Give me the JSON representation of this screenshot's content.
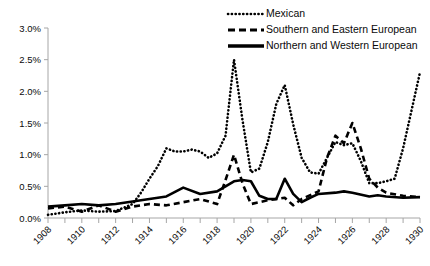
{
  "chart_data": {
    "type": "line",
    "title": "",
    "xlabel": "",
    "ylabel": "",
    "x": [
      1908,
      1909,
      1910,
      1911,
      1912,
      1913,
      1914,
      1915,
      1916,
      1917,
      1918,
      1919,
      1920,
      1921,
      1922,
      1923,
      1924,
      1925,
      1926,
      1927,
      1928,
      1929,
      1930
    ],
    "xlim": [
      1908,
      1930
    ],
    "ylim": [
      0.0,
      3.0
    ],
    "ytick_values": [
      0.0,
      0.5,
      1.0,
      1.5,
      2.0,
      2.5,
      3.0
    ],
    "ytick_labels": [
      "0.0%",
      "0.5%",
      "1.0%",
      "1.5%",
      "2.0%",
      "2.5%",
      "3.0%"
    ],
    "xtick_labels": [
      "1908",
      "1910",
      "1912",
      "1914",
      "1916",
      "1918",
      "1920",
      "1922",
      "1924",
      "1926",
      "1928",
      "1930"
    ],
    "xtick_label_values": [
      1908,
      1910,
      1912,
      1914,
      1916,
      1918,
      1920,
      1922,
      1924,
      1926,
      1928,
      1930
    ],
    "minor_xticks_every": 1,
    "grid": false,
    "legend_position": "top-right",
    "series": [
      {
        "name": "Mexican",
        "style": "dotted",
        "color": "#000000",
        "values": [
          0.05,
          0.08,
          0.1,
          0.12,
          0.1,
          0.22,
          0.52,
          0.78,
          1.1,
          1.05,
          1.05,
          0.95,
          1.02,
          0.78,
          2.5,
          1.55,
          0.72,
          0.78,
          2.1,
          1.48,
          0.72,
          0.55,
          0.6
        ]
      },
      {
        "name": "Southern and Eastern European",
        "style": "dashed",
        "color": "#000000",
        "values": [
          0.15,
          0.18,
          0.12,
          0.2,
          0.12,
          0.18,
          0.22,
          0.2,
          0.25,
          0.3,
          0.22,
          0.25,
          0.2,
          0.28,
          1.0,
          0.3,
          0.22,
          0.32,
          0.62,
          0.22,
          0.3,
          0.52,
          0.95
        ]
      },
      {
        "name": "Northern and Western European",
        "style": "solid",
        "color": "#000000",
        "values": [
          0.18,
          0.2,
          0.22,
          0.2,
          0.22,
          0.25,
          0.3,
          0.33,
          0.36,
          0.4,
          0.48,
          0.42,
          0.5,
          0.55,
          0.58,
          0.52,
          0.32,
          0.38,
          0.62,
          0.3,
          0.4,
          0.42,
          0.4
        ]
      }
    ],
    "series_full": {
      "Mexican": {
        "points": [
          {
            "x": 1908,
            "y": 0.05
          },
          {
            "x": 1908.5,
            "y": 0.07
          },
          {
            "x": 1909,
            "y": 0.09
          },
          {
            "x": 1910,
            "y": 0.12
          },
          {
            "x": 1911,
            "y": 0.1
          },
          {
            "x": 1912,
            "y": 0.11
          },
          {
            "x": 1913,
            "y": 0.22
          },
          {
            "x": 1913.5,
            "y": 0.4
          },
          {
            "x": 1914,
            "y": 0.62
          },
          {
            "x": 1914.5,
            "y": 0.82
          },
          {
            "x": 1915,
            "y": 1.1
          },
          {
            "x": 1915.5,
            "y": 1.05
          },
          {
            "x": 1916,
            "y": 1.05
          },
          {
            "x": 1916.5,
            "y": 1.08
          },
          {
            "x": 1917,
            "y": 1.05
          },
          {
            "x": 1917.5,
            "y": 0.95
          },
          {
            "x": 1918,
            "y": 1.02
          },
          {
            "x": 1918.5,
            "y": 1.3
          },
          {
            "x": 1919,
            "y": 2.5
          },
          {
            "x": 1919.5,
            "y": 1.55
          },
          {
            "x": 1920,
            "y": 0.72
          },
          {
            "x": 1920.5,
            "y": 0.78
          },
          {
            "x": 1921,
            "y": 1.2
          },
          {
            "x": 1921.5,
            "y": 1.8
          },
          {
            "x": 1922,
            "y": 2.1
          },
          {
            "x": 1922.5,
            "y": 1.48
          },
          {
            "x": 1923,
            "y": 0.95
          },
          {
            "x": 1923.5,
            "y": 0.72
          },
          {
            "x": 1924,
            "y": 0.7
          },
          {
            "x": 1924.5,
            "y": 0.95
          },
          {
            "x": 1925,
            "y": 1.2
          },
          {
            "x": 1925.5,
            "y": 1.15
          },
          {
            "x": 1926,
            "y": 1.18
          },
          {
            "x": 1926.5,
            "y": 0.9
          },
          {
            "x": 1927,
            "y": 0.55
          },
          {
            "x": 1927.5,
            "y": 0.55
          },
          {
            "x": 1928,
            "y": 0.58
          },
          {
            "x": 1928.5,
            "y": 0.62
          },
          {
            "x": 1929,
            "y": 1.1
          },
          {
            "x": 1929.5,
            "y": 1.7
          },
          {
            "x": 1930,
            "y": 2.3
          }
        ]
      },
      "Southern and Eastern European": {
        "points": [
          {
            "x": 1908,
            "y": 0.15
          },
          {
            "x": 1909,
            "y": 0.18
          },
          {
            "x": 1910,
            "y": 0.1
          },
          {
            "x": 1911,
            "y": 0.2
          },
          {
            "x": 1912,
            "y": 0.1
          },
          {
            "x": 1913,
            "y": 0.18
          },
          {
            "x": 1914,
            "y": 0.22
          },
          {
            "x": 1915,
            "y": 0.2
          },
          {
            "x": 1916,
            "y": 0.25
          },
          {
            "x": 1917,
            "y": 0.3
          },
          {
            "x": 1918,
            "y": 0.22
          },
          {
            "x": 1918.5,
            "y": 0.6
          },
          {
            "x": 1919,
            "y": 1.0
          },
          {
            "x": 1919.5,
            "y": 0.55
          },
          {
            "x": 1920,
            "y": 0.22
          },
          {
            "x": 1921,
            "y": 0.28
          },
          {
            "x": 1922,
            "y": 0.32
          },
          {
            "x": 1922.5,
            "y": 0.2
          },
          {
            "x": 1923,
            "y": 0.3
          },
          {
            "x": 1924,
            "y": 0.42
          },
          {
            "x": 1924.5,
            "y": 0.95
          },
          {
            "x": 1925,
            "y": 1.3
          },
          {
            "x": 1925.5,
            "y": 1.18
          },
          {
            "x": 1926,
            "y": 1.5
          },
          {
            "x": 1926.5,
            "y": 1.1
          },
          {
            "x": 1927,
            "y": 0.62
          },
          {
            "x": 1927.5,
            "y": 0.48
          },
          {
            "x": 1928,
            "y": 0.4
          },
          {
            "x": 1929,
            "y": 0.35
          },
          {
            "x": 1930,
            "y": 0.33
          }
        ]
      },
      "Northern and Western European": {
        "points": [
          {
            "x": 1908,
            "y": 0.18
          },
          {
            "x": 1909,
            "y": 0.2
          },
          {
            "x": 1910,
            "y": 0.22
          },
          {
            "x": 1911,
            "y": 0.2
          },
          {
            "x": 1912,
            "y": 0.22
          },
          {
            "x": 1913,
            "y": 0.26
          },
          {
            "x": 1914,
            "y": 0.3
          },
          {
            "x": 1915,
            "y": 0.34
          },
          {
            "x": 1916,
            "y": 0.48
          },
          {
            "x": 1917,
            "y": 0.38
          },
          {
            "x": 1918,
            "y": 0.42
          },
          {
            "x": 1919,
            "y": 0.58
          },
          {
            "x": 1919.5,
            "y": 0.6
          },
          {
            "x": 1920,
            "y": 0.58
          },
          {
            "x": 1920.5,
            "y": 0.35
          },
          {
            "x": 1921,
            "y": 0.3
          },
          {
            "x": 1921.5,
            "y": 0.3
          },
          {
            "x": 1922,
            "y": 0.62
          },
          {
            "x": 1922.5,
            "y": 0.38
          },
          {
            "x": 1923,
            "y": 0.25
          },
          {
            "x": 1923.5,
            "y": 0.32
          },
          {
            "x": 1924,
            "y": 0.38
          },
          {
            "x": 1925,
            "y": 0.4
          },
          {
            "x": 1925.5,
            "y": 0.42
          },
          {
            "x": 1926,
            "y": 0.4
          },
          {
            "x": 1927,
            "y": 0.34
          },
          {
            "x": 1927.5,
            "y": 0.36
          },
          {
            "x": 1928,
            "y": 0.34
          },
          {
            "x": 1929,
            "y": 0.32
          },
          {
            "x": 1930,
            "y": 0.33
          }
        ]
      }
    },
    "legend": [
      {
        "label": "Mexican",
        "style": "dotted"
      },
      {
        "label": "Southern and Eastern European",
        "style": "dashed"
      },
      {
        "label": "Northern and Western European",
        "style": "solid"
      }
    ]
  }
}
